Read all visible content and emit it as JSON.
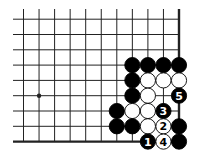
{
  "diagram": {
    "type": "go-board-partial",
    "colors": {
      "background": "#ffffff",
      "line": "#222222",
      "black": "#000000",
      "white": "#ffffff"
    },
    "grid": {
      "columns": 11,
      "rows": 9,
      "x0": 23.5,
      "dx": 15.55,
      "y0": 19.2,
      "dy": 15.3,
      "line_start_x": 13,
      "line_start_y": 9,
      "right_edge": true,
      "bottom_edge": true
    },
    "star_points": [
      {
        "col": 1,
        "row": 5
      }
    ],
    "stones": [
      {
        "col": 7,
        "row": 3,
        "color": "black",
        "label": ""
      },
      {
        "col": 8,
        "row": 3,
        "color": "black",
        "label": ""
      },
      {
        "col": 9,
        "row": 3,
        "color": "black",
        "label": ""
      },
      {
        "col": 10,
        "row": 3,
        "color": "black",
        "label": ""
      },
      {
        "col": 7,
        "row": 4,
        "color": "black",
        "label": ""
      },
      {
        "col": 8,
        "row": 4,
        "color": "white",
        "label": ""
      },
      {
        "col": 9,
        "row": 4,
        "color": "white",
        "label": ""
      },
      {
        "col": 10,
        "row": 4,
        "color": "white",
        "label": ""
      },
      {
        "col": 7,
        "row": 5,
        "color": "black",
        "label": ""
      },
      {
        "col": 8,
        "row": 5,
        "color": "white",
        "label": ""
      },
      {
        "col": 10,
        "row": 5,
        "color": "black",
        "label": "5"
      },
      {
        "col": 6,
        "row": 6,
        "color": "black",
        "label": ""
      },
      {
        "col": 7,
        "row": 6,
        "color": "white",
        "label": ""
      },
      {
        "col": 8,
        "row": 6,
        "color": "white",
        "label": ""
      },
      {
        "col": 9,
        "row": 6,
        "color": "black",
        "label": "3"
      },
      {
        "col": 6,
        "row": 7,
        "color": "black",
        "label": ""
      },
      {
        "col": 7,
        "row": 7,
        "color": "black",
        "label": ""
      },
      {
        "col": 8,
        "row": 7,
        "color": "white",
        "label": ""
      },
      {
        "col": 9,
        "row": 7,
        "color": "white",
        "label": "2"
      },
      {
        "col": 10,
        "row": 7,
        "color": "black",
        "label": ""
      },
      {
        "col": 8,
        "row": 8,
        "color": "black",
        "label": "1"
      },
      {
        "col": 9,
        "row": 8,
        "color": "white",
        "label": "4"
      },
      {
        "col": 10,
        "row": 8,
        "color": "black",
        "label": ""
      }
    ]
  }
}
